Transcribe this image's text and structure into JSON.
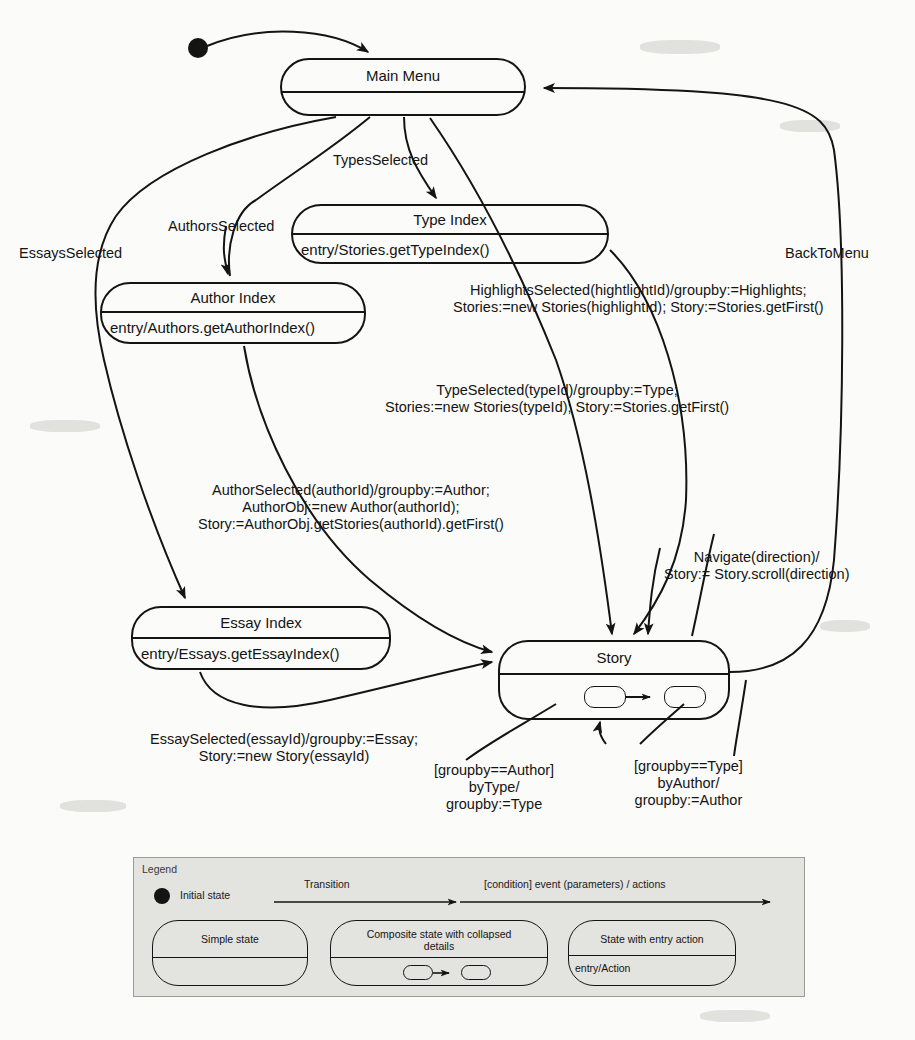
{
  "diagram": {
    "type": "uml-statechart",
    "states": [
      {
        "id": "main-menu",
        "name": "Main Menu",
        "entry": "",
        "kind": "simple"
      },
      {
        "id": "type-index",
        "name": "Type Index",
        "entry": "entry/Stories.getTypeIndex()",
        "kind": "entry-action"
      },
      {
        "id": "author-index",
        "name": "Author Index",
        "entry": "entry/Authors.getAuthorIndex()",
        "kind": "entry-action"
      },
      {
        "id": "essay-index",
        "name": "Essay Index",
        "entry": "entry/Essays.getEssayIndex()",
        "kind": "entry-action"
      },
      {
        "id": "story",
        "name": "Story",
        "entry": "",
        "kind": "composite-collapsed"
      }
    ],
    "transitions": [
      {
        "id": "t-initial",
        "label": "",
        "from": "initial",
        "to": "main-menu"
      },
      {
        "id": "t-types",
        "label": "TypesSelected",
        "from": "main-menu",
        "to": "type-index"
      },
      {
        "id": "t-authors",
        "label": "AuthorsSelected",
        "from": "main-menu",
        "to": "author-index"
      },
      {
        "id": "t-essays",
        "label": "EssaysSelected",
        "from": "main-menu",
        "to": "essay-index"
      },
      {
        "id": "t-back",
        "label": "BackToMenu",
        "from": "story",
        "to": "main-menu"
      },
      {
        "id": "t-highlights",
        "from": "main-menu",
        "to": "story",
        "label_lines": [
          "HighlightsSelected(hightlightId)/groupby:=Highlights;",
          "Stories:=new Stories(highlightId); Story:=Stories.getFirst()"
        ]
      },
      {
        "id": "t-type-selected",
        "from": "type-index",
        "to": "story",
        "label_lines": [
          "TypeSelected(typeId)/groupby:=Type;",
          "Stories:=new Stories(typeId); Story:=Stories.getFirst()"
        ]
      },
      {
        "id": "t-author-selected",
        "from": "author-index",
        "to": "story",
        "label_lines": [
          "AuthorSelected(authorId)/groupby:=Author;",
          "AuthorObj:=new Author(authorId);",
          "Story:=AuthorObj.getStories(authorId).getFirst()"
        ]
      },
      {
        "id": "t-essay-selected",
        "from": "essay-index",
        "to": "story",
        "label_lines": [
          "EssaySelected(essayId)/groupby:=Essay;",
          "Story:=new Story(essayId)"
        ]
      },
      {
        "id": "t-navigate",
        "from": "story",
        "to": "story",
        "label_lines": [
          "Navigate(direction)/",
          "Story:= Story.scroll(direction)"
        ]
      },
      {
        "id": "t-bytype",
        "from": "story",
        "to": "story",
        "label_lines": [
          "[groupby==Author]",
          "byType/",
          "groupby:=Type"
        ]
      },
      {
        "id": "t-byauthor",
        "from": "story",
        "to": "story",
        "label_lines": [
          "[groupby==Type]",
          "byAuthor/",
          "groupby:=Author"
        ]
      }
    ]
  },
  "legend": {
    "title": "Legend",
    "initial_state_label": "Initial state",
    "transition_label": "Transition",
    "transition_syntax_label": "[condition] event (parameters) / actions",
    "simple_state_label": "Simple state",
    "composite_state_label_line1": "Composite state with collapsed",
    "composite_state_label_line2": "details",
    "entry_state_label": "State with entry action",
    "entry_state_action": "entry/Action"
  },
  "colors": {
    "ink": "#141414",
    "page_background": "#fbfbf9",
    "legend_background": "#e3e3e0",
    "legend_border": "#9a9a96"
  }
}
